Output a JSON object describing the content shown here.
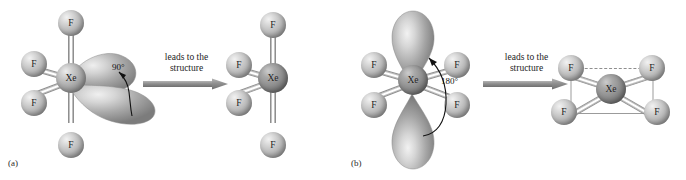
{
  "figure": {
    "colors": {
      "atom_light": "#d9d9d9",
      "atom_dark": "#8d8d8d",
      "lobe": "#9c9c9c",
      "bond": "#9a9a9a",
      "text": "#1a1a1a",
      "arrow": "#8c8c8c"
    }
  },
  "panels": [
    {
      "id": "a",
      "label": "(a)",
      "transition": {
        "line1": "leads to the",
        "line2": "structure",
        "direction": "right"
      },
      "left_structure": {
        "name": "xef4-lone-pair-equatorial",
        "center_atom": "Xe",
        "ligands": [
          "F",
          "F",
          "F",
          "F"
        ],
        "ligand_count": 4,
        "lobe_count": 2,
        "lobe_orientation": "equatorial-right",
        "angle_label": "90°"
      },
      "right_structure": {
        "name": "xef4-seesaw",
        "center_atom": "Xe",
        "ligands": [
          "F",
          "F",
          "F",
          "F"
        ],
        "ligand_count": 4,
        "geometry": "distorted"
      }
    },
    {
      "id": "b",
      "label": "(b)",
      "transition": {
        "line1": "leads to the",
        "line2": "structure",
        "direction": "right"
      },
      "left_structure": {
        "name": "xef4-lone-pair-axial",
        "center_atom": "Xe",
        "ligands": [
          "F",
          "F",
          "F",
          "F"
        ],
        "ligand_count": 4,
        "lobe_count": 2,
        "lobe_orientation": "axial-vertical",
        "angle_label": "180°"
      },
      "right_structure": {
        "name": "xef4-square-planar",
        "center_atom": "Xe",
        "ligands": [
          "F",
          "F",
          "F",
          "F"
        ],
        "ligand_count": 4,
        "geometry": "square planar"
      }
    }
  ]
}
